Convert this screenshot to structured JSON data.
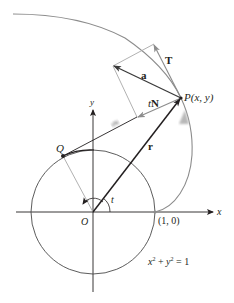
{
  "figure": {
    "type": "involute-of-circle-diagram",
    "colors": {
      "axis": "#231f20",
      "circle": "#4a4a4a",
      "involute": "#8c8c8c",
      "vector_dark": "#231f20",
      "vector_a": "#3a3a3a",
      "construction": "#a8a8a8",
      "guide_arrow": "#b8b8b8"
    },
    "labels": {
      "x_axis": "x",
      "y_axis": "y",
      "origin": "O",
      "point_q": "Q",
      "point_p": "P(x, y)",
      "point_one_zero": "(1, 0)",
      "angle": "t",
      "vector_r": "r",
      "vector_t": "T",
      "vector_a": "a",
      "vector_tn_scalar": "t",
      "vector_tn_vec": "N",
      "segment_qp_mark": "tN-scaled",
      "circle_equation_x": "x",
      "circle_equation_plus": " + ",
      "circle_equation_y": "y",
      "circle_equation_rhs": " = 1",
      "exponent": "2"
    },
    "geometry": {
      "origin": [
        93,
        212
      ],
      "radius": 62,
      "angle_t_deg": 118,
      "point_p": [
        181,
        98
      ],
      "point_q": [
        63,
        156
      ],
      "t_tip": [
        154,
        44
      ],
      "a_tip": [
        113,
        66
      ],
      "tn_tip": [
        137,
        117
      ]
    }
  }
}
